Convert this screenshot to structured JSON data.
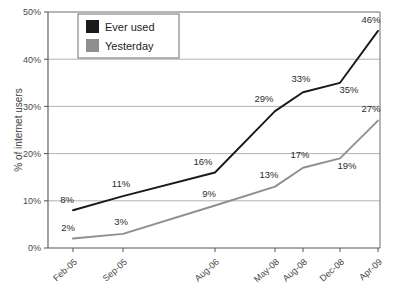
{
  "chart_data": {
    "type": "line",
    "title": "",
    "subtitle": "",
    "xlabel": "",
    "ylabel": "% of internet users",
    "categories": [
      "Feb-05",
      "Sep-05",
      "Aug-06",
      "May-08",
      "Aug-08",
      "Dec-08",
      "Apr-09"
    ],
    "x_positions": [
      73,
      123,
      215,
      275,
      303,
      340,
      378
    ],
    "ylim": [
      0,
      50
    ],
    "y_ticks": [
      "0%",
      "10%",
      "20%",
      "30%",
      "40%",
      "50%"
    ],
    "y_tick_values": [
      0,
      10,
      20,
      30,
      40,
      50
    ],
    "grid": true,
    "grid_axis": "y",
    "legend_position": "top-left-inside",
    "series": [
      {
        "name": "Ever used",
        "color": "#1a1a1a",
        "values": [
          8,
          11,
          16,
          29,
          33,
          35,
          46
        ],
        "labels": [
          "8%",
          "11%",
          "16%",
          "29%",
          "33%",
          "35%",
          "46%"
        ],
        "label_offsets": [
          {
            "dx": -6,
            "dy": -7,
            "anchor": "middle"
          },
          {
            "dx": -2,
            "dy": -9,
            "anchor": "middle"
          },
          {
            "dx": -12,
            "dy": -7,
            "anchor": "middle"
          },
          {
            "dx": -11,
            "dy": -9,
            "anchor": "middle"
          },
          {
            "dx": -2,
            "dy": -10,
            "anchor": "middle"
          },
          {
            "dx": 9,
            "dy": 10,
            "anchor": "middle"
          },
          {
            "dx": -7,
            "dy": -8,
            "anchor": "middle"
          }
        ]
      },
      {
        "name": "Yesterday",
        "color": "#8f8f8f",
        "values": [
          2,
          3,
          9,
          13,
          17,
          19,
          27
        ],
        "labels": [
          "2%",
          "3%",
          "9%",
          "13%",
          "17%",
          "19%",
          "27%"
        ],
        "label_offsets": [
          {
            "dx": -5,
            "dy": -8,
            "anchor": "middle"
          },
          {
            "dx": -2,
            "dy": -9,
            "anchor": "middle"
          },
          {
            "dx": -6,
            "dy": -9,
            "anchor": "middle"
          },
          {
            "dx": -6,
            "dy": -9,
            "anchor": "middle"
          },
          {
            "dx": -3,
            "dy": -10,
            "anchor": "middle"
          },
          {
            "dx": 7,
            "dy": 11,
            "anchor": "middle"
          },
          {
            "dx": -7,
            "dy": -9,
            "anchor": "middle"
          }
        ]
      }
    ],
    "colors": {
      "series_ever_used": "#1a1a1a",
      "series_yesterday": "#8f8f8f",
      "grid": "#b3b3b3",
      "axis": "#555555",
      "background": "#ffffff",
      "legend_border": "#6e6e6e"
    }
  },
  "legend": {
    "items": [
      {
        "label": "Ever used",
        "swatch": "#1a1a1a"
      },
      {
        "label": "Yesterday",
        "swatch": "#8f8f8f"
      }
    ]
  },
  "axes": {
    "y_title": "% of internet users",
    "y_labels": [
      "50%",
      "40%",
      "30%",
      "20%",
      "10%",
      "0%"
    ],
    "x_labels": [
      "Feb-05",
      "Sep-05",
      "Aug-06",
      "May-08",
      "Aug-08",
      "Dec-08",
      "Apr-09"
    ]
  }
}
